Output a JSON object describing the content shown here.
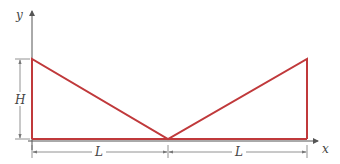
{
  "diagram": {
    "axes": {
      "x_label": "x",
      "y_label": "y"
    },
    "dimensions": {
      "height_label": "H",
      "left_span_label": "L",
      "right_span_label": "L"
    },
    "shape": {
      "description": "Two triangles sharing a valley point on the x-axis, with vertical edges of height H at x=0 and x=2L",
      "points": [
        [
          0,
          "H"
        ],
        [
          "L",
          0
        ],
        [
          "2L",
          "H"
        ]
      ]
    },
    "colors": {
      "shape_stroke": "#c0393b",
      "axis": "#555555",
      "dimension": "#777777",
      "background": "#ffffff"
    }
  }
}
